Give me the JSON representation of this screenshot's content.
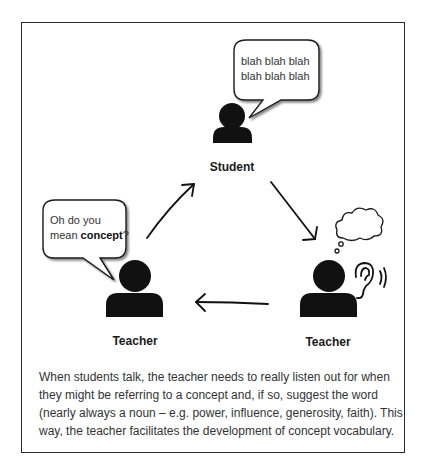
{
  "diagram": {
    "nodes": {
      "student": {
        "label": "Student",
        "speech": [
          "blah blah blah",
          "blah blah  blah"
        ]
      },
      "teacher_left": {
        "label": "Teacher",
        "speech_line1": "Oh do you",
        "speech_line2_prefix": "mean ",
        "speech_line2_bold": "concept",
        "speech_line2_suffix": "?"
      },
      "teacher_right": {
        "label": "Teacher",
        "icons": [
          "thought-cloud-icon",
          "ear-listening-icon"
        ]
      }
    },
    "arrows": [
      {
        "from": "teacher_left",
        "to": "student"
      },
      {
        "from": "student",
        "to": "teacher_right"
      },
      {
        "from": "teacher_right",
        "to": "teacher_left"
      }
    ]
  },
  "caption": {
    "lines": [
      "When students talk, the teacher needs to really listen out for when",
      "they might be referring to a concept and, if so, suggest the word",
      "(nearly always a noun – e.g. power, influence, generosity, faith). This",
      "way, the teacher facilitates the development of concept vocabulary."
    ]
  },
  "colors": {
    "ink": "#111111",
    "text": "#333333",
    "border": "#2a2a2a",
    "background": "#ffffff"
  }
}
